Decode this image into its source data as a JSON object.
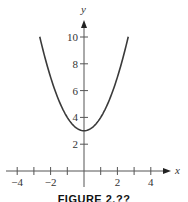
{
  "chart_data": {
    "type": "line",
    "title": "",
    "xlabel": "x",
    "ylabel": "y",
    "function": "y = x^2 + 3",
    "xlim": [
      -4.7,
      5.2
    ],
    "ylim": [
      0,
      11.5
    ],
    "x_ticks": [
      -4,
      -3,
      -2,
      -1,
      1,
      2,
      3,
      4
    ],
    "x_tick_labels": [
      "-4",
      "-2",
      "2",
      "4"
    ],
    "x_tick_label_values": [
      -4,
      -2,
      2,
      4
    ],
    "y_ticks": [
      2,
      4,
      6,
      8,
      10
    ],
    "y_tick_labels": [
      "2",
      "4",
      "6",
      "8",
      "10"
    ],
    "grid": false,
    "legend": null,
    "series": [
      {
        "name": "f(x)",
        "x": [
          -2.65,
          -2.5,
          -2,
          -1.5,
          -1,
          -0.5,
          0,
          0.5,
          1,
          1.5,
          2,
          2.5,
          2.65
        ],
        "y": [
          10.02,
          9.25,
          7,
          5.25,
          4,
          3.25,
          3,
          3.25,
          4,
          5.25,
          7,
          9.25,
          10.02
        ],
        "color": "#3a3a3a"
      }
    ],
    "vertex": [
      0,
      3
    ]
  },
  "caption": "FIGURE 2.??"
}
